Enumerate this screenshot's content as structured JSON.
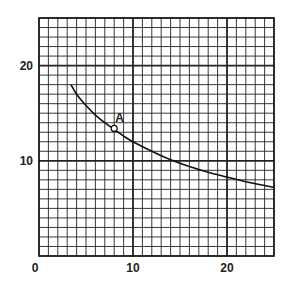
{
  "chart_data": {
    "type": "line",
    "title": "",
    "xlabel": "",
    "ylabel": "",
    "xlim": [
      0,
      25
    ],
    "ylim": [
      0,
      25
    ],
    "grid": true,
    "minor_grid_step": 1,
    "major_grid_step": 10,
    "x_ticks": [
      {
        "value": 0,
        "label": "0"
      },
      {
        "value": 10,
        "label": "10"
      },
      {
        "value": 20,
        "label": "20"
      }
    ],
    "y_ticks": [
      {
        "value": 10,
        "label": "10"
      },
      {
        "value": 20,
        "label": "20"
      }
    ],
    "series": [
      {
        "name": "curve",
        "x": [
          3.4,
          4,
          5,
          6,
          7,
          8,
          9,
          10,
          12,
          14,
          16,
          18,
          20,
          22,
          25
        ],
        "y": [
          18.0,
          17.0,
          15.8,
          14.8,
          14.0,
          13.3,
          12.6,
          12.0,
          11.0,
          10.1,
          9.4,
          8.8,
          8.3,
          7.8,
          7.2
        ]
      }
    ],
    "annotations": [
      {
        "label": "A",
        "x": 8.0,
        "y": 13.4,
        "marker": "open-circle"
      }
    ],
    "legend": null
  }
}
